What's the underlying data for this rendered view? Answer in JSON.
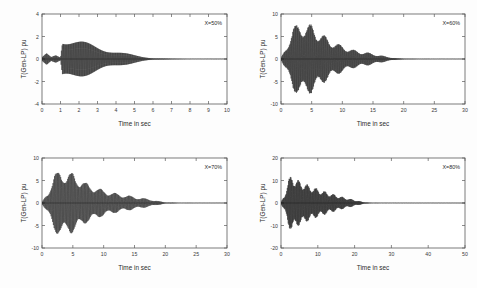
{
  "figure": {
    "background": "#fdfdfd",
    "trace_color": "#111111",
    "axis_color": "#5a5a5a"
  },
  "chart_data": [
    {
      "type": "line",
      "panel": "top-left",
      "title": "",
      "xlabel": "Time in sec",
      "ylabel": "T(Gen-LP) pu",
      "annotation": "X=50%",
      "xlim": [
        0,
        10
      ],
      "ylim": [
        -4,
        4
      ],
      "xticks": [
        0,
        1,
        2,
        3,
        4,
        5,
        6,
        7,
        8,
        9,
        10
      ],
      "xticklabels": [
        "0",
        "1",
        "2",
        "3",
        "4",
        "5",
        "6",
        "7",
        "8",
        "9",
        "10"
      ],
      "yticks": [
        -4,
        -2,
        0,
        2,
        4
      ],
      "yticklabels": [
        "-4",
        "-2",
        "0",
        "2",
        "4"
      ],
      "grid": false,
      "legend": "none",
      "series": [
        {
          "name": "T(Gen-LP)",
          "description": "Torsional torque: small low-amplitude transient from 0 to 1.1 s, abrupt growth to peak of about +1.8 / -2.6 pu at 1.1 s, then monotonic exponential decay settling near 0 by 6 s, flat thereafter to 10 s.",
          "oscillation_frequency_hz": 26,
          "envelope_points": [
            {
              "t": 0.0,
              "amp": 0.15
            },
            {
              "t": 0.25,
              "amp": 0.55
            },
            {
              "t": 0.5,
              "amp": 0.2
            },
            {
              "t": 0.75,
              "amp": 0.45
            },
            {
              "t": 1.0,
              "amp": 0.2
            },
            {
              "t": 1.1,
              "amp": 2.2
            },
            {
              "t": 1.5,
              "amp": 2.0
            },
            {
              "t": 2.0,
              "amp": 1.75
            },
            {
              "t": 2.5,
              "amp": 1.5
            },
            {
              "t": 3.0,
              "amp": 1.25
            },
            {
              "t": 3.5,
              "amp": 1.0
            },
            {
              "t": 4.0,
              "amp": 0.78
            },
            {
              "t": 4.5,
              "amp": 0.56
            },
            {
              "t": 5.0,
              "amp": 0.36
            },
            {
              "t": 5.5,
              "amp": 0.2
            },
            {
              "t": 6.0,
              "amp": 0.09
            },
            {
              "t": 7.0,
              "amp": 0.03
            },
            {
              "t": 8.0,
              "amp": 0.015
            },
            {
              "t": 10.0,
              "amp": 0.01
            }
          ],
          "offset": 0.0
        }
      ]
    },
    {
      "type": "line",
      "panel": "top-right",
      "title": "",
      "xlabel": "Time in sec",
      "ylabel": "T(Gen-LP) pu",
      "annotation": "X=60%",
      "xlim": [
        0,
        30
      ],
      "ylim": [
        -10,
        10
      ],
      "xticks": [
        0,
        5,
        10,
        15,
        20,
        25,
        30
      ],
      "xticklabels": [
        "0",
        "5",
        "10",
        "15",
        "20",
        "25",
        "30"
      ],
      "yticks": [
        -10,
        -5,
        0,
        5,
        10
      ],
      "yticklabels": [
        "-10",
        "-5",
        "0",
        "5",
        "10"
      ],
      "grid": false,
      "legend": "none",
      "series": [
        {
          "name": "T(Gen-LP)",
          "description": "Fast growth to peak about +8 / -8 pu between 2 and 5 s, then beating decay through 15 s, essentially settled by 19 s and flat to 30 s.",
          "oscillation_frequency_hz": 9,
          "envelope_points": [
            {
              "t": 0.0,
              "amp": 0.2
            },
            {
              "t": 1.0,
              "amp": 3.2
            },
            {
              "t": 2.0,
              "amp": 7.2
            },
            {
              "t": 3.0,
              "amp": 8.0
            },
            {
              "t": 4.0,
              "amp": 7.6
            },
            {
              "t": 5.0,
              "amp": 7.8
            },
            {
              "t": 6.0,
              "amp": 6.2
            },
            {
              "t": 7.0,
              "amp": 5.4
            },
            {
              "t": 8.0,
              "amp": 4.2
            },
            {
              "t": 9.0,
              "amp": 3.6
            },
            {
              "t": 10.0,
              "amp": 3.0
            },
            {
              "t": 11.0,
              "amp": 2.4
            },
            {
              "t": 12.0,
              "amp": 2.0
            },
            {
              "t": 13.0,
              "amp": 1.7
            },
            {
              "t": 14.0,
              "amp": 1.5
            },
            {
              "t": 15.0,
              "amp": 1.2
            },
            {
              "t": 16.0,
              "amp": 0.9
            },
            {
              "t": 17.0,
              "amp": 0.6
            },
            {
              "t": 18.0,
              "amp": 0.35
            },
            {
              "t": 19.0,
              "amp": 0.15
            },
            {
              "t": 21.0,
              "amp": 0.06
            },
            {
              "t": 25.0,
              "amp": 0.03
            },
            {
              "t": 30.0,
              "amp": 0.02
            }
          ],
          "offset": 0.0
        }
      ]
    },
    {
      "type": "line",
      "panel": "bottom-left",
      "title": "",
      "xlabel": "Time in sec",
      "ylabel": "T(Gen-LP) pu",
      "annotation": "X=70%",
      "xlim": [
        0,
        30
      ],
      "ylim": [
        -10,
        10
      ],
      "xticks": [
        0,
        5,
        10,
        15,
        20,
        25,
        30
      ],
      "xticklabels": [
        "0",
        "5",
        "10",
        "15",
        "20",
        "25",
        "30"
      ],
      "yticks": [
        -10,
        -5,
        0,
        5,
        10
      ],
      "yticklabels": [
        "-10",
        "-5",
        "0",
        "5",
        "10"
      ],
      "grid": false,
      "legend": "none",
      "series": [
        {
          "name": "T(Gen-LP)",
          "description": "Rapid rise to peak about +7 / -7.5 pu near 3 s, sustained high amplitude to 6 s, then gradual beating decay reaching near zero at 20 s and flat to 30 s.",
          "oscillation_frequency_hz": 8,
          "envelope_points": [
            {
              "t": 0.0,
              "amp": 0.2
            },
            {
              "t": 1.0,
              "amp": 2.6
            },
            {
              "t": 2.0,
              "amp": 6.4
            },
            {
              "t": 3.0,
              "amp": 7.4
            },
            {
              "t": 4.0,
              "amp": 6.6
            },
            {
              "t": 5.0,
              "amp": 6.8
            },
            {
              "t": 6.0,
              "amp": 5.6
            },
            {
              "t": 7.0,
              "amp": 4.6
            },
            {
              "t": 8.0,
              "amp": 4.0
            },
            {
              "t": 9.0,
              "amp": 3.4
            },
            {
              "t": 10.0,
              "amp": 2.9
            },
            {
              "t": 11.0,
              "amp": 2.5
            },
            {
              "t": 12.0,
              "amp": 2.2
            },
            {
              "t": 13.0,
              "amp": 1.9
            },
            {
              "t": 14.0,
              "amp": 1.7
            },
            {
              "t": 15.0,
              "amp": 1.4
            },
            {
              "t": 16.0,
              "amp": 1.2
            },
            {
              "t": 17.0,
              "amp": 0.95
            },
            {
              "t": 18.0,
              "amp": 0.7
            },
            {
              "t": 19.0,
              "amp": 0.4
            },
            {
              "t": 20.0,
              "amp": 0.15
            },
            {
              "t": 22.0,
              "amp": 0.05
            },
            {
              "t": 26.0,
              "amp": 0.03
            },
            {
              "t": 30.0,
              "amp": 0.02
            }
          ],
          "offset": 0.0
        }
      ]
    },
    {
      "type": "line",
      "panel": "bottom-right",
      "title": "",
      "xlabel": "Time in sec",
      "ylabel": "T(Gen-LP) pu",
      "annotation": "X=80%",
      "xlim": [
        0,
        50
      ],
      "ylim": [
        -20,
        20
      ],
      "xticks": [
        0,
        10,
        20,
        30,
        40,
        50
      ],
      "xticklabels": [
        "0",
        "10",
        "20",
        "30",
        "40",
        "50"
      ],
      "yticks": [
        -20,
        -10,
        0,
        10,
        20
      ],
      "yticklabels": [
        "-20",
        "-10",
        "0",
        "10",
        "20"
      ],
      "grid": false,
      "legend": "none",
      "series": [
        {
          "name": "T(Gen-LP)",
          "description": "Sharp rise to peak about +13 / -12 pu near 3 s, then slow exponential decay with beating through 20 s, settling to zero by 24 s and flat to 50 s.",
          "oscillation_frequency_hz": 6,
          "envelope_points": [
            {
              "t": 0.0,
              "amp": 0.3
            },
            {
              "t": 1.0,
              "amp": 4.0
            },
            {
              "t": 2.0,
              "amp": 10.5
            },
            {
              "t": 3.0,
              "amp": 13.0
            },
            {
              "t": 4.0,
              "amp": 11.0
            },
            {
              "t": 5.0,
              "amp": 10.0
            },
            {
              "t": 6.0,
              "amp": 9.5
            },
            {
              "t": 7.0,
              "amp": 8.4
            },
            {
              "t": 8.0,
              "amp": 7.8
            },
            {
              "t": 9.0,
              "amp": 7.0
            },
            {
              "t": 10.0,
              "amp": 6.4
            },
            {
              "t": 11.0,
              "amp": 5.8
            },
            {
              "t": 12.0,
              "amp": 5.2
            },
            {
              "t": 13.0,
              "amp": 4.6
            },
            {
              "t": 14.0,
              "amp": 4.1
            },
            {
              "t": 15.0,
              "amp": 3.6
            },
            {
              "t": 16.0,
              "amp": 3.1
            },
            {
              "t": 17.0,
              "amp": 2.6
            },
            {
              "t": 18.0,
              "amp": 2.2
            },
            {
              "t": 19.0,
              "amp": 1.8
            },
            {
              "t": 20.0,
              "amp": 1.4
            },
            {
              "t": 21.0,
              "amp": 1.0
            },
            {
              "t": 22.0,
              "amp": 0.6
            },
            {
              "t": 23.0,
              "amp": 0.3
            },
            {
              "t": 24.0,
              "amp": 0.12
            },
            {
              "t": 27.0,
              "amp": 0.06
            },
            {
              "t": 35.0,
              "amp": 0.04
            },
            {
              "t": 50.0,
              "amp": 0.03
            }
          ],
          "offset": 0.0
        }
      ]
    }
  ]
}
